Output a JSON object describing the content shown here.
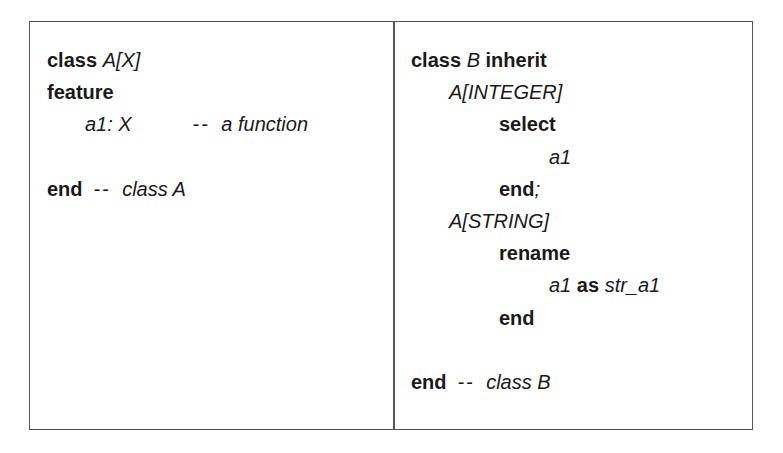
{
  "listing": {
    "left": {
      "title": "class A",
      "lines": [
        {
          "indent": 0,
          "segments": [
            {
              "t": "class",
              "s": "kw"
            },
            {
              "t": " ",
              "s": ""
            },
            {
              "t": "A[X]",
              "s": "it"
            }
          ]
        },
        {
          "indent": 0,
          "segments": [
            {
              "t": "feature",
              "s": "kw"
            }
          ]
        },
        {
          "indent": 1,
          "segments": [
            {
              "t": "a1: X",
              "s": "it"
            },
            {
              "t": "           ",
              "s": ""
            },
            {
              "t": "--",
              "s": "dash"
            },
            {
              "t": "  ",
              "s": ""
            },
            {
              "t": "a function",
              "s": "cm"
            }
          ]
        },
        {
          "indent": 0,
          "segments": []
        },
        {
          "indent": 0,
          "segments": [
            {
              "t": "end",
              "s": "kw"
            },
            {
              "t": "  ",
              "s": ""
            },
            {
              "t": "--",
              "s": "dash"
            },
            {
              "t": "  ",
              "s": ""
            },
            {
              "t": "class A",
              "s": "cm"
            }
          ]
        }
      ]
    },
    "right": {
      "title": "class B",
      "lines": [
        {
          "indent": 0,
          "segments": [
            {
              "t": "class",
              "s": "kw"
            },
            {
              "t": " ",
              "s": ""
            },
            {
              "t": "B",
              "s": "it"
            },
            {
              "t": " ",
              "s": ""
            },
            {
              "t": "inherit",
              "s": "kw"
            }
          ]
        },
        {
          "indent": 1,
          "segments": [
            {
              "t": "A[INTEGER]",
              "s": "it"
            }
          ]
        },
        {
          "indent": 2,
          "segments": [
            {
              "t": "select",
              "s": "kw"
            }
          ]
        },
        {
          "indent": 3,
          "segments": [
            {
              "t": "a1",
              "s": "it"
            }
          ]
        },
        {
          "indent": 2,
          "segments": [
            {
              "t": "end",
              "s": "kw"
            },
            {
              "t": ";",
              "s": "it"
            }
          ]
        },
        {
          "indent": 1,
          "segments": [
            {
              "t": "A[STRING]",
              "s": "it"
            }
          ]
        },
        {
          "indent": 2,
          "segments": [
            {
              "t": "rename",
              "s": "kw"
            }
          ]
        },
        {
          "indent": 3,
          "segments": [
            {
              "t": "a1",
              "s": "it"
            },
            {
              "t": " ",
              "s": ""
            },
            {
              "t": "as",
              "s": "kw"
            },
            {
              "t": " ",
              "s": ""
            },
            {
              "t": "str_a1",
              "s": "it"
            }
          ]
        },
        {
          "indent": 2,
          "segments": [
            {
              "t": "end",
              "s": "kw"
            }
          ]
        },
        {
          "indent": 0,
          "segments": []
        },
        {
          "indent": 0,
          "segments": [
            {
              "t": "end",
              "s": "kw"
            },
            {
              "t": "  ",
              "s": ""
            },
            {
              "t": "--",
              "s": "dash"
            },
            {
              "t": "  ",
              "s": ""
            },
            {
              "t": "class B",
              "s": "cm"
            }
          ]
        }
      ]
    }
  },
  "style": {
    "border_color": "#555555",
    "text_color": "#1a1a1a",
    "background": "#ffffff"
  }
}
